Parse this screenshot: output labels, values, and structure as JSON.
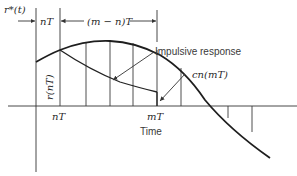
{
  "figure": {
    "y_axis_label": "r*(t)",
    "x_axis_label": "Time",
    "dimension_labels": {
      "first_interval": "nT",
      "second_interval": "(m − n)T"
    },
    "tick_labels": {
      "n": "nT",
      "m": "mT"
    },
    "sample_value_label": "r(nT)",
    "annotations": {
      "impulsive_response": "Impulsive response",
      "output_sample": "cn(mT)"
    },
    "colors": {
      "background": "#ffffff",
      "ink": "#222222"
    }
  }
}
